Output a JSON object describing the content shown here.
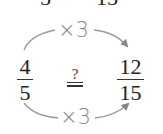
{
  "top_cut": {
    "left_digit": "5",
    "right_digit": "15"
  },
  "left_fraction": {
    "numerator": "4",
    "denominator": "5"
  },
  "right_fraction": {
    "numerator": "12",
    "denominator": "15"
  },
  "relation": {
    "question": "?",
    "symbol": "="
  },
  "top_operation": "×3",
  "bottom_operation": "×3",
  "colors": {
    "text": "#222222",
    "arrow": "#888888"
  }
}
